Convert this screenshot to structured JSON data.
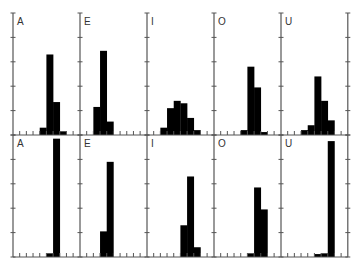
{
  "chart_data": {
    "type": "bar",
    "title": "",
    "layout": {
      "rows": 2,
      "cols": 5,
      "grid": false,
      "legend": "none"
    },
    "xlabel": "",
    "ylabel": "",
    "x_bins": 10,
    "ylim": [
      0,
      5
    ],
    "y_ticks": [
      0,
      1,
      2,
      3,
      4,
      5
    ],
    "bar_color": "#000000",
    "panels": [
      {
        "row": 0,
        "label": "A",
        "bins": [
          0,
          0,
          0,
          0,
          0.3,
          3.3,
          1.35,
          0.15,
          0,
          0
        ]
      },
      {
        "row": 0,
        "label": "E",
        "bins": [
          0,
          0,
          1.15,
          3.45,
          0.55,
          0,
          0,
          0,
          0,
          0
        ]
      },
      {
        "row": 0,
        "label": "I",
        "bins": [
          0,
          0,
          0.3,
          1.1,
          1.4,
          1.3,
          0.7,
          0.2,
          0,
          0
        ]
      },
      {
        "row": 0,
        "label": "O",
        "bins": [
          0,
          0,
          0,
          0,
          0.2,
          2.8,
          1.95,
          0.12,
          0,
          0
        ]
      },
      {
        "row": 0,
        "label": "U",
        "bins": [
          0,
          0,
          0,
          0.2,
          0.4,
          2.4,
          1.4,
          0.6,
          0,
          0
        ]
      },
      {
        "row": 1,
        "label": "A",
        "bins": [
          0,
          0,
          0,
          0,
          0,
          0.15,
          4.85,
          0,
          0,
          0
        ]
      },
      {
        "row": 1,
        "label": "E",
        "bins": [
          0,
          0,
          0,
          1.05,
          3.9,
          0,
          0,
          0,
          0,
          0
        ]
      },
      {
        "row": 1,
        "label": "I",
        "bins": [
          0,
          0,
          0,
          0,
          0,
          1.3,
          3.3,
          0.4,
          0,
          0
        ]
      },
      {
        "row": 1,
        "label": "O",
        "bins": [
          0,
          0,
          0,
          0,
          0,
          0.15,
          2.85,
          1.95,
          0,
          0
        ]
      },
      {
        "row": 1,
        "label": "U",
        "bins": [
          0,
          0,
          0,
          0,
          0,
          0.12,
          0.15,
          4.75,
          0,
          0
        ]
      }
    ]
  }
}
